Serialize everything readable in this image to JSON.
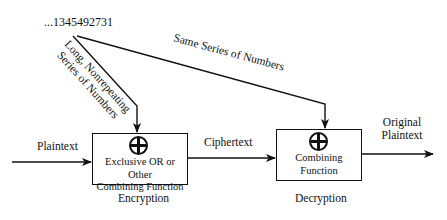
{
  "diagram": {
    "type": "stream-cipher",
    "key_stream": "...1345492731",
    "key_label_encrypt": [
      "Long, Nonrepeating",
      "Series of Numbers"
    ],
    "key_label_decrypt": "Same Series of Numbers",
    "input_label": "Plaintext",
    "middle_label": "Ciphertext",
    "output_label": [
      "Original",
      "Plaintext"
    ],
    "encrypt_box": {
      "symbol": "xor-circle",
      "text": [
        "Exclusive OR or Other",
        "Combining Function"
      ],
      "caption": "Encryption"
    },
    "decrypt_box": {
      "symbol": "xor-circle",
      "text": [
        "Combining",
        "Function"
      ],
      "caption": "Decryption"
    }
  }
}
